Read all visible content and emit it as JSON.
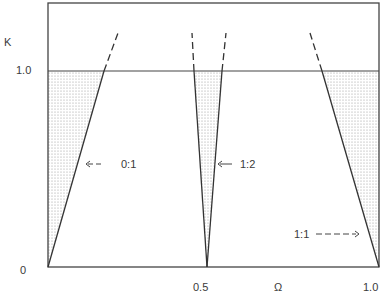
{
  "diagram": {
    "y_axis": {
      "label": "K",
      "ticks": [
        "1.0",
        "0"
      ]
    },
    "x_axis": {
      "label": "Ω",
      "ticks": [
        "0.5",
        "1.0"
      ]
    },
    "k_line": 1.0,
    "tongues": [
      {
        "name": "0:1",
        "label": "0:1",
        "arrow": "←--",
        "center": 0.0
      },
      {
        "name": "1:2",
        "label": "1:2",
        "arrow": "←",
        "center": 0.5
      },
      {
        "name": "1:1",
        "label": "1:1",
        "arrow": "---→",
        "center": 1.0
      }
    ],
    "colors": {
      "line": "#333333",
      "shade": "#bdbdbd",
      "background": "#ffffff"
    }
  }
}
